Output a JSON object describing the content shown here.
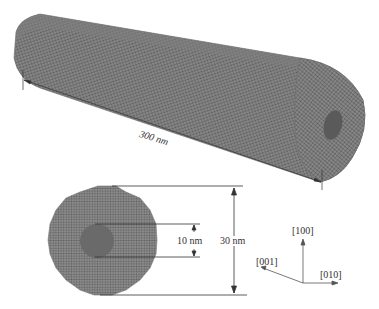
{
  "figure": {
    "type": "nanowire-schematic",
    "colors": {
      "atom_fill": "#7a7a7a",
      "atom_dark": "#555555",
      "hole_fill": "#5f5f5f",
      "line": "#333333",
      "background": "#ffffff"
    }
  },
  "labels": {
    "length": "300 nm",
    "inner_diameter": "10 nm",
    "outer_diameter": "30 nm"
  },
  "axes": {
    "up": "[100]",
    "left": "[001]",
    "right": "[010]"
  }
}
